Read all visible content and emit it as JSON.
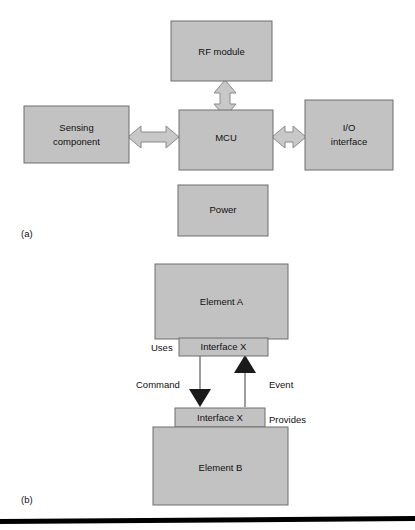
{
  "figure": {
    "width": 415,
    "height": 530,
    "background": "#ffffff",
    "box_fill": "#c2c2c2",
    "box_stroke": "#6e6e6e",
    "arrow_block_fill": "#c8c8c8",
    "arrow_solid_fill": "#1a1a1a",
    "rule_color": "#000000"
  },
  "panel_a": {
    "caption": "(a)",
    "boxes": {
      "rf_module": "RF module",
      "sensing_component_line1": "Sensing",
      "sensing_component_line2": "component",
      "mcu": "MCU",
      "io_interface_line1": "I/O",
      "io_interface_line2": "interface",
      "power": "Power"
    },
    "connectors": [
      {
        "name": "mcu-to-rf-module",
        "style": "double-headed-block-arrow",
        "orientation": "vertical"
      },
      {
        "name": "sensing-to-mcu",
        "style": "double-headed-block-arrow",
        "orientation": "horizontal"
      },
      {
        "name": "mcu-to-io",
        "style": "double-headed-block-arrow",
        "orientation": "horizontal"
      }
    ]
  },
  "panel_b": {
    "caption": "(b)",
    "boxes": {
      "element_a": "Element A",
      "interface_x_top": "Interface X",
      "interface_x_bottom": "Interface X",
      "element_b": "Element B"
    },
    "labels": {
      "uses": "Uses",
      "command": "Command",
      "event": "Event",
      "provides": "Provides"
    },
    "connectors": [
      {
        "name": "command-arrow",
        "style": "solid-triangle-arrow",
        "direction": "down",
        "label": "Command"
      },
      {
        "name": "event-arrow",
        "style": "solid-triangle-arrow",
        "direction": "up",
        "label": "Event"
      }
    ]
  }
}
